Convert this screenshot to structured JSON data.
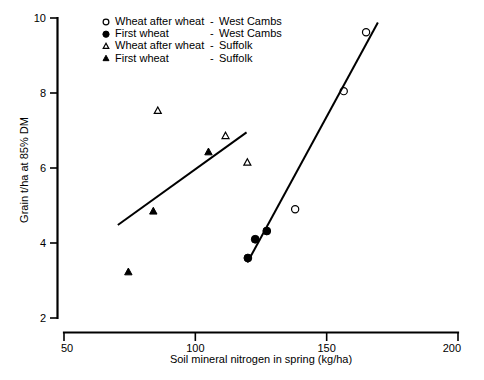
{
  "chart_data": {
    "type": "scatter",
    "title": "",
    "xlabel": "Soil mineral nitrogen in spring (kg/ha)",
    "ylabel": "Grain t/ha at 85% DM",
    "xlim": [
      50,
      200
    ],
    "ylim": [
      2,
      10
    ],
    "xticks": [
      50,
      100,
      150,
      200
    ],
    "yticks": [
      2,
      4,
      6,
      8,
      10
    ],
    "xtick_labels": [
      "50",
      "100",
      "150",
      "200"
    ],
    "ytick_labels": [
      "2",
      "4",
      "6",
      "8",
      "10"
    ],
    "grid": false,
    "legend_position": "top-center",
    "series": [
      {
        "name": "Wheat after wheat  -  West Cambs",
        "marker": "open-circle",
        "points": [
          {
            "x": 138.0,
            "y": 4.9
          },
          {
            "x": 156.5,
            "y": 8.05
          },
          {
            "x": 165.0,
            "y": 9.62
          }
        ]
      },
      {
        "name": "First wheat  -  West Cambs",
        "marker": "filled-circle",
        "points": [
          {
            "x": 120.0,
            "y": 3.6
          },
          {
            "x": 122.8,
            "y": 4.1
          },
          {
            "x": 127.2,
            "y": 4.32
          }
        ]
      },
      {
        "name": "Wheat after wheat  -  Suffolk",
        "marker": "open-triangle",
        "points": [
          {
            "x": 85.7,
            "y": 7.52
          },
          {
            "x": 111.5,
            "y": 6.85
          },
          {
            "x": 119.8,
            "y": 6.14
          }
        ]
      },
      {
        "name": "First wheat  -  Suffolk",
        "marker": "filled-triangle",
        "points": [
          {
            "x": 74.5,
            "y": 3.22
          },
          {
            "x": 84.0,
            "y": 4.84
          },
          {
            "x": 105.0,
            "y": 6.42
          }
        ]
      }
    ],
    "fit_lines": [
      {
        "name": "suffolk-regression-line",
        "x0": 70.5,
        "y0": 4.48,
        "x1": 119.5,
        "y1": 6.95
      },
      {
        "name": "west-cambs-regression-line",
        "x0": 119.8,
        "y0": 3.48,
        "x1": 169.5,
        "y1": 9.88
      }
    ]
  },
  "legend": {
    "entries": [
      {
        "marker": "open-circle",
        "label": "Wheat after wheat",
        "dash": "-",
        "site": "West Cambs"
      },
      {
        "marker": "filled-circle",
        "label": "First wheat",
        "dash": "-",
        "site": "West Cambs"
      },
      {
        "marker": "open-triangle",
        "label": "Wheat after wheat",
        "dash": "-",
        "site": "Suffolk"
      },
      {
        "marker": "filled-triangle",
        "label": "First wheat",
        "dash": "-",
        "site": "Suffolk"
      }
    ]
  },
  "colors": {
    "ink": "#000000",
    "background": "#ffffff"
  }
}
